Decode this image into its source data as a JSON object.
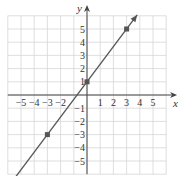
{
  "chart_data": {
    "type": "line",
    "title": "",
    "xlabel": "x",
    "ylabel": "y",
    "xlim": [
      -6,
      6
    ],
    "ylim": [
      -6,
      6
    ],
    "grid": true,
    "x_ticks": [
      -5,
      -4,
      -3,
      -2,
      1,
      2,
      3,
      4,
      5
    ],
    "y_ticks": [
      5,
      4,
      3,
      2,
      1,
      -1,
      -2,
      -3,
      -4,
      -5
    ],
    "x_tick_labels": [
      "−5",
      "−4",
      "−3",
      "−2",
      "1",
      "2",
      "3",
      "4",
      "5"
    ],
    "y_tick_labels": [
      "5",
      "4",
      "3",
      "2",
      "1",
      "−1",
      "−2",
      "−3",
      "−4",
      "−5"
    ],
    "series": [
      {
        "name": "line",
        "slope": 1.3333,
        "intercept": 1,
        "points": [
          {
            "x": -3,
            "y": -3
          },
          {
            "x": 0,
            "y": 1
          },
          {
            "x": 3,
            "y": 5
          }
        ],
        "arrows_both_ends": true,
        "color": "#555555"
      }
    ]
  },
  "axes": {
    "x_label": "x",
    "y_label": "y"
  }
}
